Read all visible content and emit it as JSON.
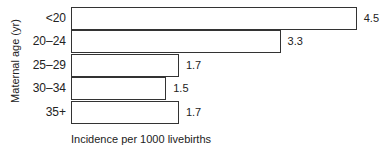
{
  "chart_data": {
    "type": "bar",
    "orientation": "horizontal",
    "title": "",
    "xlabel": "Incidence per 1000 livebirths",
    "ylabel": "Maternal age (yr)",
    "categories": [
      "<20",
      "20–24",
      "25–29",
      "30–34",
      "35+"
    ],
    "values": [
      4.5,
      3.3,
      1.7,
      1.5,
      1.7
    ],
    "value_labels": [
      "4.5",
      "3.3",
      "1.7",
      "1.5",
      "1.7"
    ],
    "grid": false,
    "legend": null
  }
}
